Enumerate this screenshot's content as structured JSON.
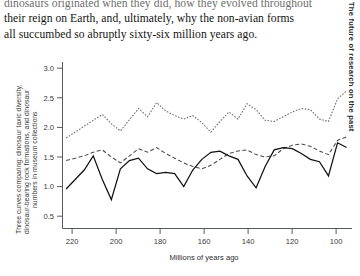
{
  "page": {
    "running_head": "The future of research on the past",
    "paragraph_lines": [
      "dinosaurs originated when they did, how they evolved throughout",
      "their reign on Earth, and, ultimately, why the non-avian forms",
      "all succumbed so abruptly sixty-six million years ago."
    ]
  },
  "figure": {
    "ylabel_lines": [
      "Three curves comparing: dinosaur taxic diversity,",
      "dinosaur-bearing rock formations, and dinosaur",
      "numbers in museum collections"
    ],
    "xlabel": "Millions of years ago",
    "x_tick_labels": [
      "220",
      "200",
      "180",
      "160",
      "140",
      "120",
      "100",
      "80"
    ],
    "y_tick_labels": [
      "0.5",
      "1.0",
      "1.5",
      "2.0",
      "2.5",
      "3.0"
    ]
  },
  "chart_data": {
    "type": "line",
    "title": "",
    "xlabel": "Millions of years ago",
    "ylabel": "Three curves comparing: dinosaur taxic diversity, dinosaur-bearing rock formations, and dinosaur numbers in museum collections",
    "xlim": [
      230,
      70
    ],
    "ylim": [
      0.4,
      3.15
    ],
    "x_ticks": [
      220,
      200,
      180,
      160,
      140,
      120,
      100,
      80
    ],
    "y_ticks": [
      0.5,
      1.0,
      1.5,
      2.0,
      2.5,
      3.0
    ],
    "x_axis_reversed": true,
    "grid": false,
    "legend": "none",
    "x": [
      228,
      223,
      218,
      213,
      208,
      203,
      198,
      193,
      188,
      183,
      178,
      173,
      168,
      163,
      158,
      153,
      148,
      143,
      138,
      133,
      128,
      123,
      118,
      113,
      108,
      103,
      98,
      93,
      88,
      83,
      78,
      73
    ],
    "series": [
      {
        "name": "dinosaur-bearing rock formations",
        "style": "dotted",
        "values": [
          1.82,
          1.92,
          2.02,
          2.12,
          2.22,
          2.06,
          1.94,
          2.13,
          2.32,
          2.18,
          2.42,
          2.28,
          2.2,
          2.14,
          2.2,
          2.08,
          1.92,
          2.1,
          2.26,
          2.14,
          2.4,
          2.3,
          2.12,
          2.1,
          2.18,
          2.26,
          2.32,
          2.3,
          2.14,
          2.1,
          2.48,
          2.62
        ]
      },
      {
        "name": "dinosaur numbers in museum collections",
        "style": "dashed",
        "values": [
          1.44,
          1.48,
          1.52,
          1.58,
          1.62,
          1.5,
          1.4,
          1.52,
          1.64,
          1.58,
          1.66,
          1.56,
          1.48,
          1.4,
          1.34,
          1.3,
          1.36,
          1.46,
          1.56,
          1.6,
          1.62,
          1.54,
          1.5,
          1.52,
          1.64,
          1.7,
          1.72,
          1.68,
          1.6,
          1.54,
          1.78,
          1.84
        ]
      },
      {
        "name": "dinosaur taxic diversity",
        "style": "solid",
        "values": [
          0.96,
          1.12,
          1.28,
          1.52,
          1.12,
          0.78,
          1.3,
          1.44,
          1.48,
          1.3,
          1.22,
          1.24,
          1.22,
          1.0,
          1.28,
          1.46,
          1.58,
          1.6,
          1.52,
          1.46,
          1.18,
          0.98,
          1.34,
          1.62,
          1.66,
          1.64,
          1.56,
          1.46,
          1.42,
          1.18,
          1.74,
          1.66
        ]
      }
    ]
  }
}
